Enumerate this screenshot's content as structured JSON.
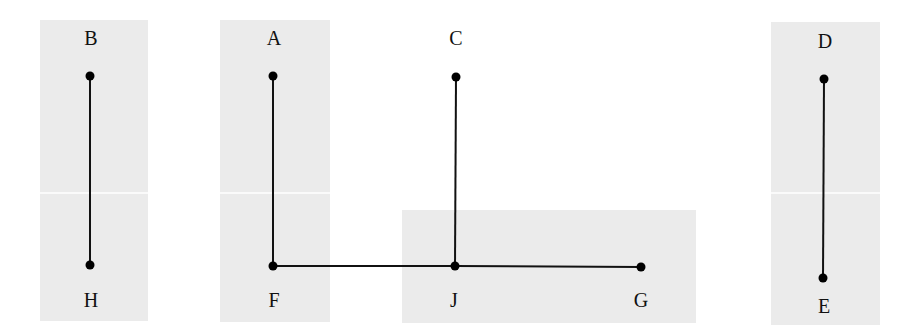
{
  "diagram": {
    "type": "graph",
    "background": "#ffffff",
    "region_color": "#ebebeb",
    "separator_color": "#ffffff",
    "edge_color": "#111111",
    "node_color": "#000000",
    "regions": [
      {
        "id": "region-bh",
        "x": 40,
        "y": 20,
        "w": 108,
        "h": 301
      },
      {
        "id": "region-af",
        "x": 220,
        "y": 20,
        "w": 110,
        "h": 302
      },
      {
        "id": "region-jg",
        "x": 402,
        "y": 210,
        "w": 294,
        "h": 113
      },
      {
        "id": "region-de",
        "x": 771,
        "y": 22,
        "w": 109,
        "h": 303
      }
    ],
    "separator_y": 193,
    "nodes": [
      {
        "id": "B",
        "label": "B",
        "x": 90,
        "y": 76,
        "label_x": 91,
        "label_y": 45
      },
      {
        "id": "H",
        "label": "H",
        "x": 90,
        "y": 265,
        "label_x": 91,
        "label_y": 307
      },
      {
        "id": "A",
        "label": "A",
        "x": 273,
        "y": 76,
        "label_x": 274,
        "label_y": 45
      },
      {
        "id": "F",
        "label": "F",
        "x": 273,
        "y": 266,
        "label_x": 274,
        "label_y": 307
      },
      {
        "id": "C",
        "label": "C",
        "x": 456,
        "y": 77,
        "label_x": 456,
        "label_y": 45
      },
      {
        "id": "J",
        "label": "J",
        "x": 455,
        "y": 266,
        "label_x": 454,
        "label_y": 307
      },
      {
        "id": "G",
        "label": "G",
        "x": 641,
        "y": 267,
        "label_x": 641,
        "label_y": 307
      },
      {
        "id": "D",
        "label": "D",
        "x": 824,
        "y": 79,
        "label_x": 825,
        "label_y": 48
      },
      {
        "id": "E",
        "label": "E",
        "x": 823,
        "y": 278,
        "label_x": 824,
        "label_y": 313
      }
    ],
    "edges": [
      {
        "from": "B",
        "to": "H"
      },
      {
        "from": "A",
        "to": "F"
      },
      {
        "from": "F",
        "to": "J"
      },
      {
        "from": "C",
        "to": "J"
      },
      {
        "from": "J",
        "to": "G"
      },
      {
        "from": "D",
        "to": "E"
      }
    ]
  }
}
